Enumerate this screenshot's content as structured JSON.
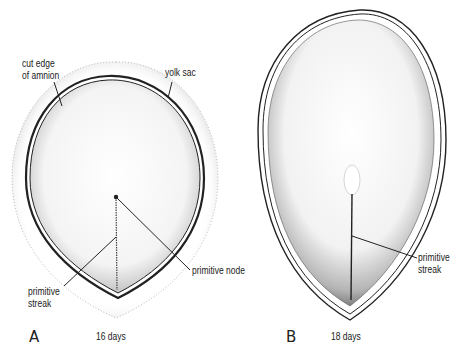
{
  "figure": {
    "panels": [
      {
        "letter": "A",
        "age": "16 days",
        "labels": {
          "cut_edge_of_amnion_line1": "cut edge",
          "cut_edge_of_amnion_line2": "of amnion",
          "yolk_sac": "yolk sac",
          "primitive_node": "primitive node",
          "primitive_streak_line1": "primitive",
          "primitive_streak_line2": "streak"
        }
      },
      {
        "letter": "B",
        "age": "18 days",
        "labels": {
          "primitive_streak_line1": "primitive",
          "primitive_streak_line2": "streak"
        }
      }
    ],
    "colors": {
      "ink": "#222222",
      "background": "#ffffff"
    }
  }
}
